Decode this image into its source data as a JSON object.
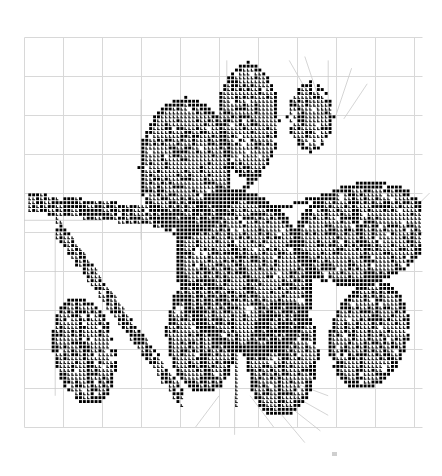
{
  "document": {
    "title": "Cross Stitch Chart",
    "subject": "flowering branch with leaves",
    "background_color": "#ffffff"
  },
  "grid": {
    "visible": true,
    "origin_x": 24,
    "origin_y": 37,
    "cell_size": 3.9,
    "cols": 102,
    "rows": 100,
    "minor_color": "#f2f2f2",
    "major_color": "#d8d8d8",
    "major_every": 10,
    "minor_visible": false
  },
  "symbols": {
    "solid": {
      "key": "solid-square",
      "glyph": "■",
      "color": "#000000",
      "name": "filled square stitch"
    },
    "boot": {
      "key": "boot-l",
      "glyph": "L",
      "color": "#1a1a1a",
      "name": "L shaped stitch"
    },
    "light": {
      "key": "light-square",
      "glyph": "▪",
      "color": "#4d4d4d",
      "name": "small square stitch"
    }
  },
  "backstitch": {
    "color": "#c9c9c9",
    "width": 0.8,
    "name": "backstitch lines"
  },
  "mark": {
    "x": 332,
    "y": 452,
    "color": "#cfcfcf",
    "name": "corner registration mark"
  },
  "chart_data": {
    "type": "heatmap",
    "xlabel": "",
    "ylabel": "",
    "grid": true,
    "legend": [
      {
        "symbol": "solid-square",
        "label": "dark thread"
      },
      {
        "symbol": "boot-l",
        "label": "mid thread"
      }
    ],
    "regions": [
      {
        "name": "upper-left-petal",
        "shape": "ellipse",
        "cx": 41,
        "cy": 33,
        "rx": 12,
        "ry": 18,
        "fill": "boot",
        "outline": "solid",
        "density": 0.97
      },
      {
        "name": "upper-center-petal",
        "shape": "ellipse",
        "cx": 57,
        "cy": 21,
        "rx": 8,
        "ry": 15,
        "fill": "boot",
        "outline": "solid",
        "density": 0.96
      },
      {
        "name": "upper-right-petal-tip",
        "shape": "ellipse",
        "cx": 73,
        "cy": 20,
        "rx": 6,
        "ry": 9,
        "fill": "boot",
        "outline": "solid",
        "density": 0.9
      },
      {
        "name": "center-large-leaf",
        "shape": "ellipse",
        "cx": 56,
        "cy": 60,
        "rx": 17,
        "ry": 22,
        "rot": -22,
        "fill": "boot",
        "outline": "solid",
        "density": 0.97
      },
      {
        "name": "right-upper-leaf",
        "shape": "ellipse",
        "cx": 86,
        "cy": 50,
        "rx": 18,
        "ry": 13,
        "rot": -14,
        "fill": "boot",
        "outline": "solid",
        "density": 0.96
      },
      {
        "name": "right-lower-leaf",
        "shape": "ellipse",
        "cx": 88,
        "cy": 76,
        "rx": 10,
        "ry": 14,
        "rot": 16,
        "fill": "boot",
        "outline": "solid",
        "density": 0.95
      },
      {
        "name": "bottom-mid-leaf",
        "shape": "ellipse",
        "cx": 66,
        "cy": 82,
        "rx": 9,
        "ry": 15,
        "rot": 6,
        "fill": "boot",
        "outline": "solid",
        "density": 0.95
      },
      {
        "name": "bottom-left-leaf",
        "shape": "ellipse",
        "cx": 45,
        "cy": 76,
        "rx": 9,
        "ry": 15,
        "rot": -4,
        "fill": "boot",
        "outline": "solid",
        "density": 0.95
      },
      {
        "name": "left-lower-leaf",
        "shape": "ellipse",
        "cx": 15,
        "cy": 80,
        "rx": 8,
        "ry": 14,
        "rot": -10,
        "fill": "boot",
        "outline": "solid",
        "density": 0.93
      },
      {
        "name": "left-horizontal-stem",
        "shape": "band",
        "x1": 1,
        "y1": 42,
        "x2": 46,
        "y2": 47,
        "fill": "boot",
        "density": 0.9
      },
      {
        "name": "diagonal-stem-left",
        "shape": "band",
        "x1": 8,
        "y1": 48,
        "x2": 40,
        "y2": 92,
        "fill": "boot",
        "density": 0.55
      },
      {
        "name": "stem-to-flower",
        "shape": "line",
        "x1": 46,
        "y1": 48,
        "x2": 60,
        "y2": 34,
        "fill": "solid"
      },
      {
        "name": "right-stem",
        "shape": "line",
        "x1": 56,
        "y1": 46,
        "x2": 84,
        "y2": 38,
        "fill": "solid"
      },
      {
        "name": "bottom-stem",
        "shape": "line",
        "x1": 54,
        "y1": 66,
        "x2": 54,
        "y2": 94,
        "fill": "boot"
      }
    ]
  }
}
